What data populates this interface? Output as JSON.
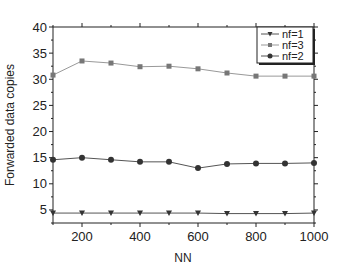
{
  "chart_data": {
    "type": "line",
    "title": "",
    "xlabel": "NN",
    "ylabel": "Forwarded data copies",
    "x": [
      100,
      200,
      300,
      400,
      500,
      600,
      700,
      800,
      900,
      1000
    ],
    "xlim": [
      100,
      1000
    ],
    "ylim": [
      2.5,
      40
    ],
    "xticks": [
      200,
      400,
      600,
      800,
      1000
    ],
    "yticks": [
      5,
      10,
      15,
      20,
      25,
      30,
      35,
      40
    ],
    "grid": false,
    "legend_position": "upper right",
    "series": [
      {
        "name": "nf=1",
        "marker": "triangle-down",
        "color": "#333333",
        "values": [
          4.4,
          4.4,
          4.4,
          4.4,
          4.4,
          4.4,
          4.3,
          4.3,
          4.3,
          4.4
        ]
      },
      {
        "name": "nf=3",
        "marker": "square",
        "color": "#777777",
        "values": [
          30.8,
          33.5,
          33.1,
          32.4,
          32.5,
          32.0,
          31.2,
          30.6,
          30.6,
          30.6
        ]
      },
      {
        "name": "nf=2",
        "marker": "circle",
        "color": "#333333",
        "values": [
          14.6,
          15.0,
          14.6,
          14.2,
          14.2,
          13.0,
          13.8,
          13.9,
          13.9,
          14.0
        ]
      }
    ]
  }
}
